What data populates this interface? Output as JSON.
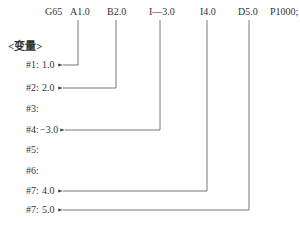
{
  "header": {
    "command": "G65",
    "args": [
      {
        "label": "A1.0",
        "x": 77
      },
      {
        "label": "B2.0",
        "x": 114
      },
      {
        "label": "I—3.0",
        "x": 150
      },
      {
        "label": "I4.0",
        "x": 199
      },
      {
        "label": "D5.0",
        "x": 242
      },
      {
        "label": "P1000;",
        "x": 271
      }
    ]
  },
  "section_title": "<变量>",
  "variables": [
    {
      "label": "#1:",
      "value": "1.0",
      "y": 65
    },
    {
      "label": "#2:",
      "value": "2.0",
      "y": 88
    },
    {
      "label": "#3:",
      "value": "",
      "y": 109
    },
    {
      "label": "#4:",
      "value": "−3.0",
      "y": 130
    },
    {
      "label": "#5:",
      "value": "",
      "y": 150
    },
    {
      "label": "#6:",
      "value": "",
      "y": 171
    },
    {
      "label": "#7:",
      "value": "4.0",
      "y": 191
    },
    {
      "label": "#7:",
      "value": "5.0",
      "y": 210
    }
  ],
  "connectors": [
    {
      "from": "A1.0",
      "to": "#1",
      "x": 78,
      "y": 65,
      "end_x": 62
    },
    {
      "from": "B2.0",
      "to": "#2",
      "x": 116,
      "y": 88,
      "end_x": 62
    },
    {
      "from": "I—3.0",
      "to": "#4",
      "x": 160,
      "y": 130,
      "end_x": 64
    },
    {
      "from": "I4.0",
      "to": "#7",
      "x": 207,
      "y": 191,
      "end_x": 62
    },
    {
      "from": "D5.0",
      "to": "#7",
      "x": 249,
      "y": 210,
      "end_x": 62
    }
  ],
  "colors": {
    "text": "#333333",
    "line": "#555555"
  }
}
